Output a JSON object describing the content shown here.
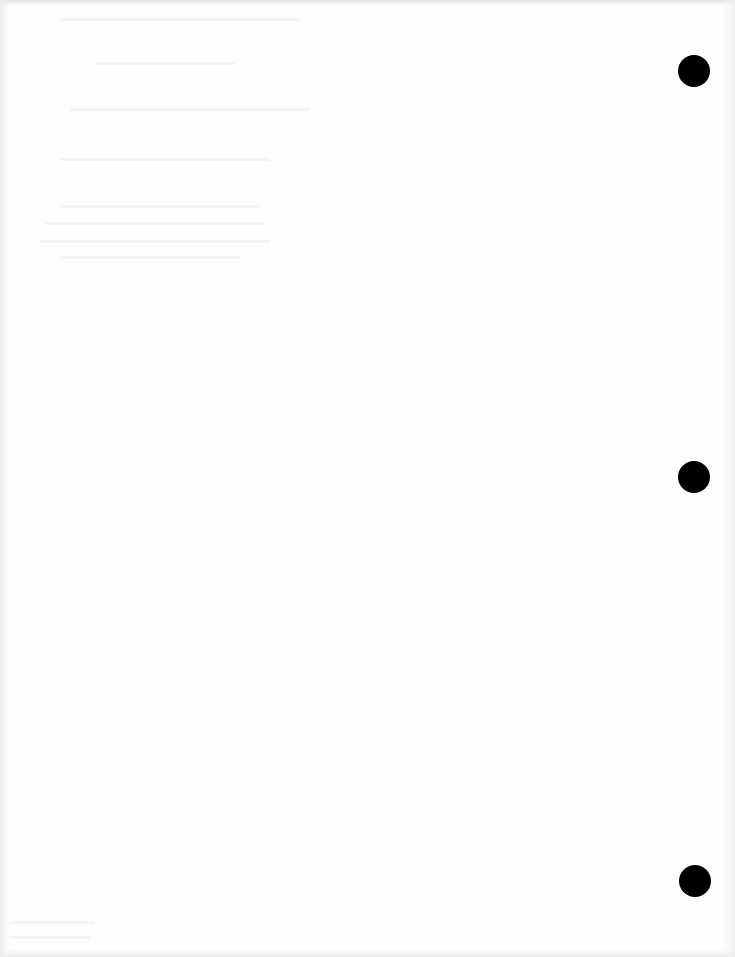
{
  "document": {
    "type": "blank scanned page",
    "background_color": "#fefefe",
    "punch_holes": [
      {
        "x": 694,
        "y": 71,
        "diameter": 32,
        "color": "#000000"
      },
      {
        "x": 694,
        "y": 477,
        "diameter": 32,
        "color": "#000000"
      },
      {
        "x": 695,
        "y": 881,
        "diameter": 32,
        "color": "#000000"
      }
    ]
  }
}
